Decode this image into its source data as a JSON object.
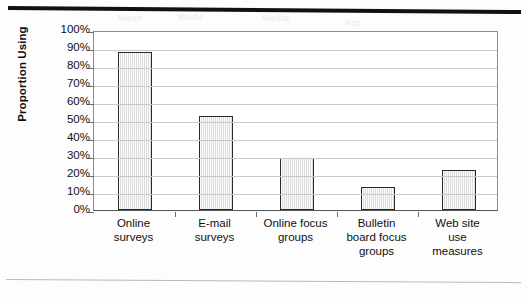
{
  "page": {
    "ghost_text": [
      "Mean",
      "Mode",
      "Media",
      "Pct"
    ]
  },
  "chart_data": {
    "type": "bar",
    "title": "",
    "xlabel": "",
    "ylabel": "Proportion Using",
    "categories": [
      "Online surveys",
      "E-mail surveys",
      "Online focus groups",
      "Bulletin board focus groups",
      "Web site use measures"
    ],
    "category_lines": [
      [
        "Online",
        "surveys"
      ],
      [
        "E-mail",
        "surveys"
      ],
      [
        "Online focus",
        "groups"
      ],
      [
        "Bulletin",
        "board focus",
        "groups"
      ],
      [
        "Web site",
        "use",
        "measures"
      ]
    ],
    "values": [
      88,
      52,
      29,
      13,
      22
    ],
    "value_labels": [
      "88%",
      "52%",
      "29%",
      "13%",
      "22%"
    ],
    "ylim": [
      0,
      100
    ],
    "ytick_values": [
      100,
      90,
      80,
      70,
      60,
      50,
      40,
      30,
      20,
      10,
      0
    ],
    "ytick_labels": [
      "100%",
      "90%",
      "80%",
      "70%",
      "60%",
      "50%",
      "40%",
      "30%",
      "20%",
      "10%",
      "0%"
    ],
    "grid": true,
    "legend": "none",
    "colors": {
      "bar_fill": "#ededed",
      "bar_border": "#2a2a2a",
      "gridline": "#c9c9c9",
      "axis": "#555555",
      "text": "#101010"
    }
  }
}
